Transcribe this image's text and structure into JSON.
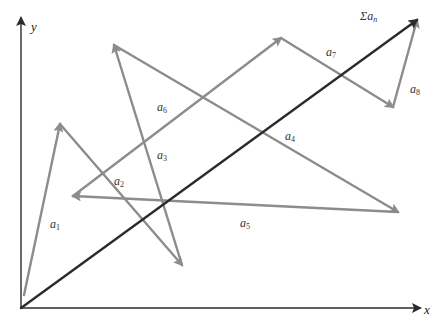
{
  "diagram": {
    "title": "",
    "colors": {
      "axis": "#2b2b2b",
      "vector": "#8c8c8c",
      "resultant": "#2b2b2b",
      "label": "#333333"
    },
    "axes": {
      "origin": [
        21,
        308
      ],
      "x": {
        "label": "x",
        "end": [
          420,
          308
        ]
      },
      "y": {
        "label": "y",
        "end": [
          21,
          18
        ]
      }
    },
    "vectors": [
      {
        "id": "a1",
        "symbol": "a",
        "sub": "1",
        "from": [
          24,
          295
        ],
        "to": [
          60,
          124
        ],
        "label_pos": [
          50,
          218
        ]
      },
      {
        "id": "a2",
        "symbol": "a",
        "sub": "2",
        "from": [
          60,
          124
        ],
        "to": [
          182,
          265
        ],
        "label_pos": [
          114,
          175
        ]
      },
      {
        "id": "a3",
        "symbol": "a",
        "sub": "3",
        "from": [
          182,
          265
        ],
        "to": [
          114,
          45
        ],
        "label_pos": [
          157,
          149
        ]
      },
      {
        "id": "a4",
        "symbol": "a",
        "sub": "4",
        "from": [
          114,
          45
        ],
        "to": [
          398,
          212
        ],
        "label_pos": [
          285,
          130
        ]
      },
      {
        "id": "a5",
        "symbol": "a",
        "sub": "5",
        "from": [
          398,
          212
        ],
        "to": [
          73,
          196
        ],
        "label_pos": [
          240,
          217
        ]
      },
      {
        "id": "a6",
        "symbol": "a",
        "sub": "6",
        "from": [
          73,
          196
        ],
        "to": [
          281,
          38
        ],
        "label_pos": [
          157,
          101
        ]
      },
      {
        "id": "a7",
        "symbol": "a",
        "sub": "7",
        "from": [
          281,
          38
        ],
        "to": [
          393,
          107
        ],
        "label_pos": [
          326,
          46
        ]
      },
      {
        "id": "a8",
        "symbol": "a",
        "sub": "8",
        "from": [
          393,
          107
        ],
        "to": [
          417,
          20
        ],
        "label_pos": [
          410,
          83
        ]
      }
    ],
    "resultant": {
      "id": "sum",
      "symbol": "Σa",
      "sub": "n",
      "from": [
        21,
        308
      ],
      "to": [
        417,
        20
      ],
      "label_pos": [
        360,
        10
      ]
    }
  }
}
